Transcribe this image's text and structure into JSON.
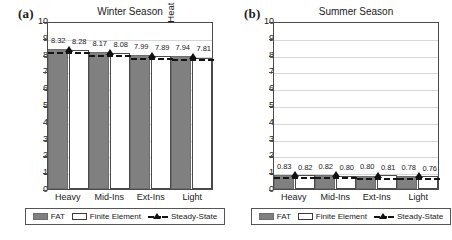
{
  "figure": {
    "width": 452,
    "height": 240,
    "background": "#ffffff"
  },
  "colors": {
    "fat_fill": "#808080",
    "fe_fill": "#ffffff",
    "axis": "#4a4a4a",
    "grid": "#d6d6d6",
    "steady_state": "#101010"
  },
  "legend": {
    "items": [
      {
        "key": "fat",
        "label": "FAT",
        "swatch": "filled-gray-rect"
      },
      {
        "key": "finite_element",
        "label": "Finite Element",
        "swatch": "open-white-rect"
      },
      {
        "key": "steady_state",
        "label": "Steady-State",
        "swatch": "dashed-line-triangle-marker"
      }
    ]
  },
  "panels": [
    {
      "tag": "(a)",
      "title": "Winter Season",
      "ylabel_main": "Heat exchange [kWh/m",
      "ylabel_sup": "2",
      "ylabel_tail": "]",
      "yticks": [
        "0",
        "1",
        "2",
        "3",
        "4",
        "5",
        "6",
        "7",
        "8",
        "9",
        "10"
      ],
      "categories": [
        "Heavy",
        "Mid-Ins",
        "Ext-Ins",
        "Light"
      ]
    },
    {
      "tag": "(b)",
      "title": "Summer Season",
      "ylabel_main": "Heat exchange [kWh/m",
      "ylabel_sup": "2",
      "ylabel_tail": "]",
      "yticks": [
        "0",
        "1",
        "2",
        "3",
        "4",
        "5",
        "6",
        "7",
        "8",
        "9",
        "10"
      ],
      "categories": [
        "Heavy",
        "Mid-Ins",
        "Ext-Ins",
        "Light"
      ]
    }
  ],
  "chart_data": [
    {
      "type": "bar",
      "title": "Winter Season",
      "panel_tag": "(a)",
      "xlabel": "",
      "ylabel": "Heat exchange [kWh/m2]",
      "ylim": [
        0,
        10
      ],
      "ytick_step": 1,
      "grid": true,
      "legend_position": "bottom",
      "categories": [
        "Heavy",
        "Mid-Ins",
        "Ext-Ins",
        "Light"
      ],
      "series": [
        {
          "name": "FAT",
          "type": "bar",
          "values": [
            8.32,
            8.17,
            7.99,
            7.94
          ],
          "labels": [
            "8.32",
            "8.17",
            "7.99",
            "7.94"
          ]
        },
        {
          "name": "Finite Element",
          "type": "bar",
          "values": [
            8.28,
            8.08,
            7.89,
            7.81
          ],
          "labels": [
            "8.28",
            "8.08",
            "7.89",
            "7.81"
          ]
        },
        {
          "name": "Steady-State",
          "type": "line",
          "values": [
            8.3,
            8.12,
            7.93,
            7.86
          ]
        }
      ]
    },
    {
      "type": "bar",
      "title": "Summer Season",
      "panel_tag": "(b)",
      "xlabel": "",
      "ylabel": "Heat exchange [kWh/m2]",
      "ylim": [
        0,
        10
      ],
      "ytick_step": 1,
      "grid": true,
      "legend_position": "bottom",
      "categories": [
        "Heavy",
        "Mid-Ins",
        "Ext-Ins",
        "Light"
      ],
      "series": [
        {
          "name": "FAT",
          "type": "bar",
          "values": [
            0.83,
            0.82,
            0.8,
            0.78
          ],
          "labels": [
            "0.83",
            "0.82",
            "0.80",
            "0.78"
          ]
        },
        {
          "name": "Finite Element",
          "type": "bar",
          "values": [
            0.82,
            0.8,
            0.81,
            0.76
          ],
          "labels": [
            "0.82",
            "0.80",
            "0.81",
            "0.76"
          ]
        },
        {
          "name": "Steady-State",
          "type": "line",
          "values": [
            0.82,
            0.81,
            0.8,
            0.77
          ]
        }
      ]
    }
  ]
}
